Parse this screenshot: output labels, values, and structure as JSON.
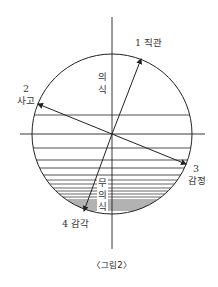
{
  "figure": {
    "caption": "〈그림2〉",
    "colors": {
      "line": "#222222",
      "text": "#333333",
      "background": "#ffffff"
    },
    "circle": {
      "cx": 112,
      "cy": 134,
      "r": 80
    },
    "axes": {
      "vertical": {
        "x": 112,
        "y1": 17,
        "y2": 249
      },
      "horizontal": {
        "y": 134,
        "x1": 20,
        "x2": 205
      }
    },
    "strata_lines_y": [
      115,
      148,
      160,
      168,
      175,
      180,
      184,
      188,
      191,
      194,
      197,
      200,
      202,
      204,
      206,
      208,
      210
    ],
    "regions": {
      "upper": {
        "label_chars": [
          "의",
          "식"
        ],
        "label": "의식"
      },
      "lower": {
        "label_chars": [
          "무",
          "의",
          "식"
        ],
        "label": "무의식"
      }
    },
    "functions": [
      {
        "id": 1,
        "number": "1",
        "name": "직관",
        "label": "1 직관",
        "tip": [
          141,
          59
        ]
      },
      {
        "id": 2,
        "number": "2",
        "name": "사고",
        "label": "2 사고",
        "tip": [
          38,
          104
        ]
      },
      {
        "id": 3,
        "number": "3",
        "name": "감정",
        "label": "3 감정",
        "tip": [
          186,
          164
        ]
      },
      {
        "id": 4,
        "number": "4",
        "name": "감각",
        "label": "4 감각",
        "tip": [
          84,
          211
        ]
      }
    ]
  }
}
